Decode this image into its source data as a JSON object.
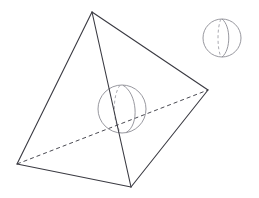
{
  "figure": {
    "canvas": {
      "width": 259,
      "height": 198,
      "background": "#ffffff"
    },
    "style": {
      "edge_color": "#3a3a42",
      "hidden_edge_color": "#4a4a52",
      "sphere_color": "#8c8c94",
      "sphere_hidden_color": "#a0a0a8",
      "edge_width": 1.1,
      "hidden_edge_width": 1.0,
      "sphere_width": 0.9,
      "hidden_dash_pattern": "4,3",
      "sphere_dash_pattern": "3,2.5"
    },
    "tetrahedron": {
      "label": "tetrahedron",
      "vertices": {
        "apex": {
          "name": "apex-vertex",
          "x": 92,
          "y": 12
        },
        "left": {
          "name": "left-vertex",
          "x": 17,
          "y": 164
        },
        "bottom": {
          "name": "bottom-front-vertex",
          "x": 131,
          "y": 187
        },
        "right": {
          "name": "right-vertex",
          "x": 208,
          "y": 90
        }
      },
      "visible_edges": [
        {
          "name": "edge-apex-left",
          "from": "apex",
          "to": "left",
          "path": "M 92 12 L 17 164"
        },
        {
          "name": "edge-apex-bottom",
          "from": "apex",
          "to": "bottom",
          "path": "M 92 12 L 131 187"
        },
        {
          "name": "edge-apex-right",
          "from": "apex",
          "to": "right",
          "path": "M 92 12 L 208 90"
        },
        {
          "name": "edge-left-bottom",
          "from": "left",
          "to": "bottom",
          "path": "M 17 164 L 131 187"
        },
        {
          "name": "edge-bottom-right",
          "from": "bottom",
          "to": "right",
          "path": "M 131 187 L 208 90"
        }
      ],
      "hidden_edges": [
        {
          "name": "edge-left-right-hidden",
          "from": "left",
          "to": "right",
          "path": "M 17 164 L 208 90"
        }
      ]
    },
    "inscribed_sphere": {
      "label": "inscribed-sphere",
      "center": {
        "x": 122,
        "y": 109
      },
      "radius": 24,
      "outline_path": "M 98 109 A 24 24 0 1 0 146 109 A 24 24 0 1 0 98 109",
      "meridian_solid_path": "M 123 85.3 C 137 93 140 125 126 132.6",
      "meridian_hidden_path": "M 120 85.2 C 112.5 95 112 122 121 132.8"
    },
    "detached_sphere": {
      "label": "detached-sphere",
      "center": {
        "x": 222,
        "y": 38
      },
      "radius": 19,
      "outline_path": "M 203 38 A 19 19 0 1 0 241 38 A 19 19 0 1 0 203 38",
      "meridian_solid_path": "M 222 19 C 231 26 231 50 222 57",
      "meridian_hidden_path": "M 221 19.1 C 217 27 217 49 221 56.9"
    }
  }
}
